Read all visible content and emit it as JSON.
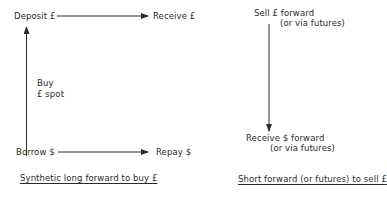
{
  "left_diagram": {
    "deposit": "Deposit £",
    "receive": "Receive £",
    "buy_line1": "Buy",
    "buy_line2": "£ spot",
    "borrow": "Borrow $",
    "repay": "Repay $",
    "caption": "Synthetic long forward to buy £"
  },
  "right_diagram": {
    "sell_line1": "Sell £ forward",
    "sell_line2": "(or via futures)",
    "receive_line1": "Receive $ forward",
    "receive_line2": "(or via futures)",
    "caption": "Short forward (or futures) to sell £"
  },
  "colors": {
    "ink": "#2a2a2a",
    "background": "#ffffff"
  }
}
